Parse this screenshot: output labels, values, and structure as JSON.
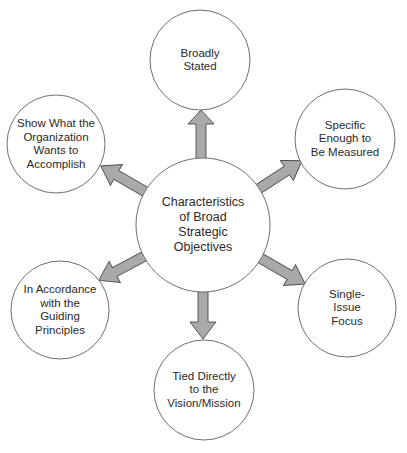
{
  "diagram": {
    "title": "Characteristics of Broad Strategic Objectives",
    "center": {
      "label": "Characteristics\nof Broad\nStrategic\nObjectives"
    },
    "nodes": [
      {
        "id": "top",
        "label": "Broadly\nStated"
      },
      {
        "id": "upper-right",
        "label": "Specific\nEnough to\nBe Measured"
      },
      {
        "id": "lower-right",
        "label": "Single-\nIssue\nFocus"
      },
      {
        "id": "bottom",
        "label": "Tied Directly\nto the\nVision/Mission"
      },
      {
        "id": "lower-left",
        "label": "In Accordance\nwith the\nGuiding\nPrinciples"
      },
      {
        "id": "upper-left",
        "label": "Show What the\nOrganization\nWants to\nAccomplish"
      }
    ],
    "colors": {
      "arrow_fill": "#a9a9a9",
      "arrow_stroke": "#4a4a4a",
      "circle_stroke": "#6e6e6e",
      "text": "#2a2a2a"
    }
  }
}
